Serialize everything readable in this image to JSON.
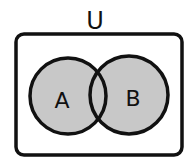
{
  "diagram": {
    "type": "venn",
    "universe_label": "U",
    "sets": [
      {
        "label": "A",
        "fill": "#c8c8c8"
      },
      {
        "label": "B",
        "fill": "#c8c8c8"
      }
    ],
    "shaded_region": "A union B",
    "colors": {
      "stroke": "#111111",
      "shade": "#c8c8c8",
      "background": "#ffffff"
    }
  }
}
